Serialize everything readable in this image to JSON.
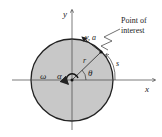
{
  "diagram": {
    "axes": {
      "x_label": "x",
      "y_label": "y"
    },
    "labels": {
      "point_of_interest_line1": "Point of",
      "point_of_interest_line2": "interest",
      "velocity_accel": "v, a",
      "radius": "r",
      "angle": "θ",
      "arc_length": "s",
      "angular_velocity": "ω",
      "angular_accel": "α"
    },
    "colors": {
      "disk_fill": "#c8c8c8",
      "stroke": "#222222"
    }
  }
}
